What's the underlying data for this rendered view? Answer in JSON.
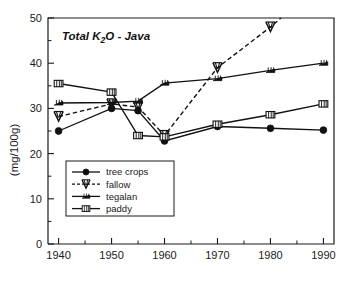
{
  "chart_data": {
    "type": "line",
    "title": "Total K2O - Java",
    "title_display": "Total K",
    "title_sub": "2",
    "title_tail": "O - Java",
    "xlabel": "",
    "ylabel": "(mg/100g)",
    "xlim": [
      1938,
      1992
    ],
    "ylim": [
      0,
      50
    ],
    "grid": false,
    "legend_position": "lower-left-inside",
    "x_ticks": [
      "1940",
      "1950",
      "1960",
      "1970",
      "1980",
      "1990"
    ],
    "x_tick_values": [
      1940,
      1950,
      1960,
      1970,
      1980,
      1990
    ],
    "x_minor_ticks": [
      1945,
      1955,
      1965,
      1975,
      1985
    ],
    "y_ticks": [
      "0",
      "10",
      "20",
      "30",
      "40",
      "50"
    ],
    "y_tick_values": [
      0,
      10,
      20,
      30,
      40,
      50
    ],
    "y_minor_ticks": [
      5,
      15,
      25,
      35,
      45
    ],
    "series": [
      {
        "name": "tree crops",
        "marker": "filled-circle",
        "linestyle": "solid",
        "x": [
          1940,
          1950,
          1955,
          1960,
          1970,
          1980,
          1990
        ],
        "values": [
          25.0,
          30.0,
          29.5,
          22.8,
          26.0,
          25.6,
          25.2
        ]
      },
      {
        "name": "fallow",
        "marker": "w-triangle",
        "linestyle": "dashed",
        "x": [
          1940,
          1950,
          1955,
          1960,
          1970,
          1980,
          1982
        ],
        "values": [
          28.2,
          31.0,
          30.3,
          24.0,
          39.0,
          48.0,
          50.0
        ]
      },
      {
        "name": "tegalan",
        "marker": "tegalan-glyph",
        "linestyle": "solid",
        "x": [
          1940,
          1950,
          1955,
          1960,
          1970,
          1980,
          1990
        ],
        "values": [
          31.2,
          31.3,
          31.6,
          35.6,
          36.6,
          38.4,
          40.0
        ]
      },
      {
        "name": "paddy",
        "marker": "box",
        "linestyle": "solid",
        "x": [
          1940,
          1950,
          1955,
          1960,
          1970,
          1980,
          1990
        ],
        "values": [
          35.5,
          33.6,
          24.0,
          23.7,
          26.5,
          28.6,
          31.0
        ]
      }
    ]
  },
  "legend": {
    "items": [
      {
        "label": "tree crops"
      },
      {
        "label": "fallow"
      },
      {
        "label": "tegalan"
      },
      {
        "label": "paddy"
      }
    ]
  },
  "colors": {
    "ink": "#111111",
    "background": "#ffffff"
  }
}
